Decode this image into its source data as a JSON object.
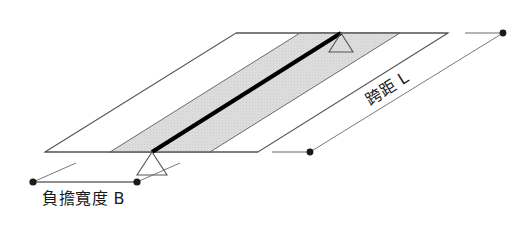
{
  "diagram": {
    "type": "isometric-structural-sketch",
    "background_color": "#ffffff",
    "slab": {
      "name": "floor-slab-parallelogram",
      "outline_color": "#555555",
      "fill_color": "#ffffff",
      "corners": {
        "bottom_left": [
          45,
          152
        ],
        "bottom_right": [
          258,
          152
        ],
        "top_right": [
          448,
          33
        ],
        "top_left": [
          236,
          33
        ]
      }
    },
    "tributary_band": {
      "name": "tributary-width-band",
      "fill_color": "#d9d9d9",
      "outline_color": "#6b6b6b",
      "corners": {
        "bottom_left": [
          110,
          152
        ],
        "bottom_right": [
          210,
          152
        ],
        "top_right": [
          400,
          33
        ],
        "top_left": [
          300,
          33
        ]
      }
    },
    "beam": {
      "name": "beam-member",
      "color": "#000000",
      "width_px": 4,
      "start": [
        152,
        152
      ],
      "end": [
        341,
        33
      ]
    },
    "supports": [
      {
        "name": "support-triangle-near",
        "apex": [
          152,
          152
        ],
        "base_half_width": 15,
        "height": 23,
        "stroke_color": "#555555"
      },
      {
        "name": "support-triangle-far",
        "apex": [
          341,
          33
        ],
        "base_half_width": 12,
        "height": 19,
        "stroke_color": "#555555"
      }
    ],
    "dimensions": [
      {
        "name": "span-dimension",
        "label": "跨距 L",
        "label_x": 390,
        "label_y": 93,
        "label_rotation_deg": -32,
        "line_color": "#555555",
        "dot_color": "#1a1a1a",
        "from_dot": [
          310,
          152
        ],
        "to_dot": [
          503,
          33
        ],
        "extension_ticks": [
          {
            "from": [
              272,
              152
            ],
            "to": [
              310,
              152
            ]
          },
          {
            "from": [
              465,
              33
            ],
            "to": [
              503,
              33
            ]
          }
        ]
      },
      {
        "name": "tributary-width-dimension",
        "label": "負擔寬度 B",
        "label_x": 42,
        "label_y": 204,
        "label_rotation_deg": 0,
        "line_color": "#555555",
        "dot_color": "#1a1a1a",
        "from_dot": [
          33,
          182
        ],
        "to_dot": [
          137,
          182
        ],
        "leader_lines": [
          {
            "from": [
              33,
              182
            ],
            "to": [
              76,
              163
            ]
          },
          {
            "from": [
              137,
              182
            ],
            "to": [
              180,
              163
            ]
          }
        ]
      }
    ]
  }
}
